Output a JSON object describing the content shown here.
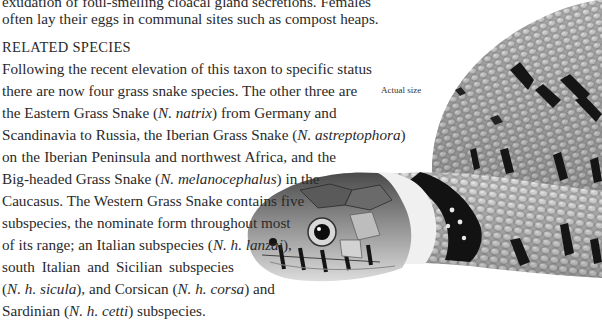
{
  "intro": {
    "lines": [
      "exudation of foul-smelling cloacal gland secretions. Females",
      "often lay their eggs in communal sites such as compost heaps."
    ]
  },
  "section": {
    "heading": "RELATED SPECIES",
    "lines": [
      {
        "parts": [
          {
            "t": "Following the recent elevation of this taxon to specific status"
          }
        ],
        "width": 334
      },
      {
        "parts": [
          {
            "t": "there are now four grass snake species. The other three are"
          }
        ],
        "width": 334
      },
      {
        "parts": [
          {
            "t": "the Eastern Grass Snake ("
          },
          {
            "t": "N. natrix",
            "i": true
          },
          {
            "t": ") from Germany and"
          }
        ],
        "width": 334
      },
      {
        "parts": [
          {
            "t": "Scandinavia to Russia, the Iberian Grass Snake ("
          },
          {
            "t": "N. astreptophora",
            "i": true
          },
          {
            "t": ")"
          }
        ],
        "width": 334
      },
      {
        "parts": [
          {
            "t": "on the Iberian Peninsula and northwest Africa, and the"
          }
        ],
        "width": 334
      },
      {
        "parts": [
          {
            "t": "Big-headed Grass Snake ("
          },
          {
            "t": "N. melanocephalus",
            "i": true
          },
          {
            "t": ") in the"
          }
        ],
        "width": 275
      },
      {
        "parts": [
          {
            "t": "Caucasus. The Western Grass Snake contains five"
          }
        ],
        "width": 255
      },
      {
        "parts": [
          {
            "t": "subspecies, the nominate form throughout most"
          }
        ],
        "width": 240
      },
      {
        "parts": [
          {
            "t": "of its range; an Italian subspecies ("
          },
          {
            "t": "N. h. lanzai",
            "i": true
          },
          {
            "t": "),"
          }
        ],
        "width": 230
      },
      {
        "parts": [
          {
            "t": "south Italian and Sicilian subspecies"
          }
        ],
        "width": 232
      },
      {
        "parts": [
          {
            "t": "("
          },
          {
            "t": "N. h. sicula",
            "i": true
          },
          {
            "t": "), and Corsican ("
          },
          {
            "t": "N. h. corsa",
            "i": true
          },
          {
            "t": ") and"
          }
        ],
        "width": 232
      },
      {
        "parts": [
          {
            "t": "Sardinian ("
          },
          {
            "t": "N. h. cetti",
            "i": true
          },
          {
            "t": ") subspecies."
          }
        ],
        "width": 0,
        "last": true
      }
    ]
  },
  "figure": {
    "caption": "Actual size",
    "colors": {
      "light_scale": "#d9d9d9",
      "mid_scale": "#9a9a9a",
      "dark_band": "#141414",
      "collar": "#f2f2f2"
    }
  }
}
